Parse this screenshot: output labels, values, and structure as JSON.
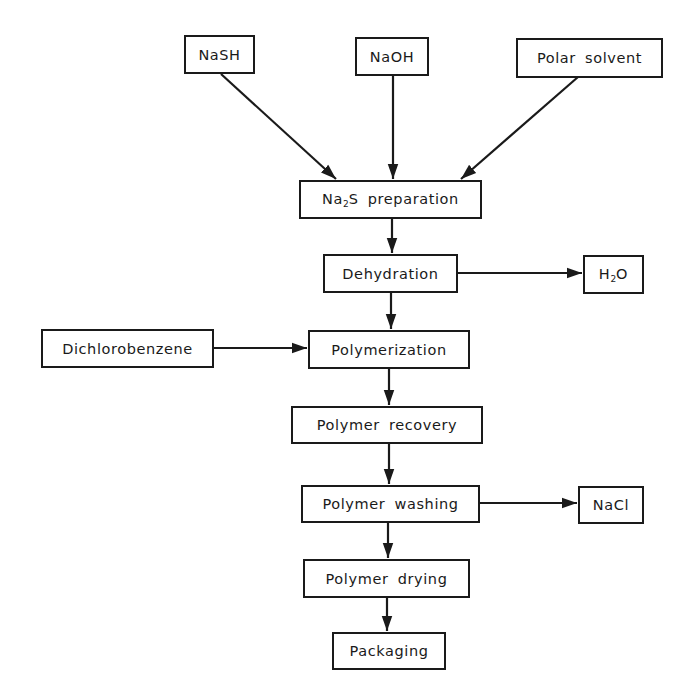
{
  "diagram": {
    "type": "process-flowchart",
    "colors": {
      "line": "#1a1a1a",
      "background": "#ffffff"
    },
    "inputs": [
      {
        "id": "nash",
        "label": "NaSH"
      },
      {
        "id": "naoh",
        "label": "NaOH"
      },
      {
        "id": "polar_solvent",
        "label": "Polar solvent"
      },
      {
        "id": "dichlorobenzene",
        "label": "Dichlorobenzene"
      }
    ],
    "steps": [
      {
        "id": "na2s_prep",
        "label_pre": "Na",
        "label_sub": "2",
        "label_post": "S preparation"
      },
      {
        "id": "dehydration",
        "label": "Dehydration"
      },
      {
        "id": "polymerization",
        "label": "Polymerization"
      },
      {
        "id": "polymer_recovery",
        "label": "Polymer recovery"
      },
      {
        "id": "polymer_washing",
        "label": "Polymer washing"
      },
      {
        "id": "polymer_drying",
        "label": "Polymer drying"
      },
      {
        "id": "packaging",
        "label": "Packaging"
      }
    ],
    "outputs": [
      {
        "id": "h2o",
        "label_pre": "H",
        "label_sub": "2",
        "label_post": "O"
      },
      {
        "id": "nacl",
        "label": "NaCl"
      }
    ],
    "edges": [
      {
        "from": "nash",
        "to": "na2s_prep"
      },
      {
        "from": "naoh",
        "to": "na2s_prep"
      },
      {
        "from": "polar_solvent",
        "to": "na2s_prep"
      },
      {
        "from": "na2s_prep",
        "to": "dehydration"
      },
      {
        "from": "dehydration",
        "to": "h2o"
      },
      {
        "from": "dehydration",
        "to": "polymerization"
      },
      {
        "from": "dichlorobenzene",
        "to": "polymerization"
      },
      {
        "from": "polymerization",
        "to": "polymer_recovery"
      },
      {
        "from": "polymer_recovery",
        "to": "polymer_washing"
      },
      {
        "from": "polymer_washing",
        "to": "nacl"
      },
      {
        "from": "polymer_washing",
        "to": "polymer_drying"
      },
      {
        "from": "polymer_drying",
        "to": "packaging"
      }
    ]
  }
}
